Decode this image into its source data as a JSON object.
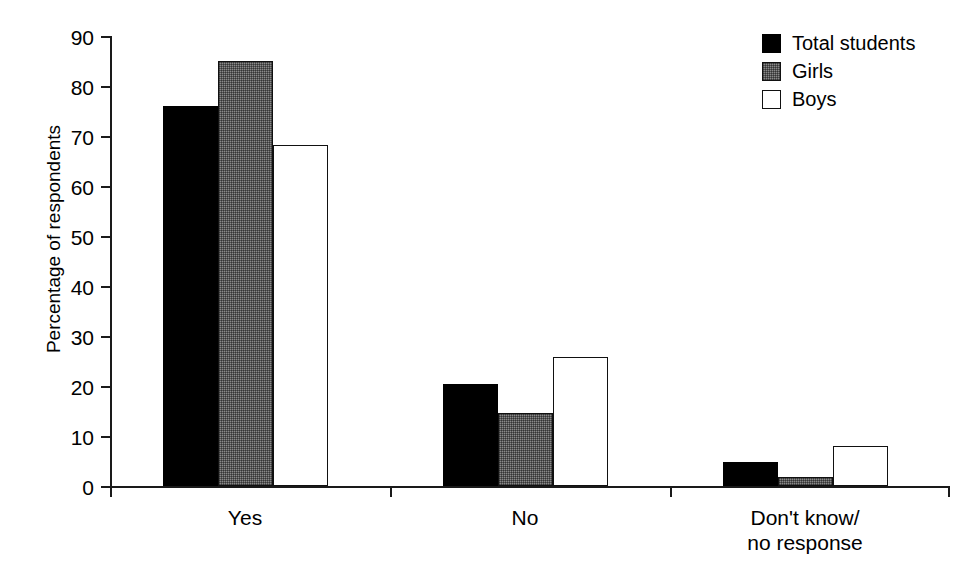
{
  "chart_data": {
    "type": "bar",
    "title": "",
    "xlabel": "",
    "ylabel": "Percentage of respondents",
    "ylim": [
      0,
      90
    ],
    "yticks": [
      0,
      10,
      20,
      30,
      40,
      50,
      60,
      70,
      80,
      90
    ],
    "ytick_labels": [
      "0",
      "10",
      "20",
      "30",
      "40",
      "50",
      "60",
      "70",
      "80",
      "90"
    ],
    "grid": false,
    "legend_position": "top-right",
    "categories": [
      "Yes",
      "No",
      "Don't know/\nno response"
    ],
    "category_lines": [
      [
        "Yes"
      ],
      [
        "No"
      ],
      [
        "Don't know/",
        "no response"
      ]
    ],
    "series": [
      {
        "name": "Total students",
        "color": "#000000",
        "fill": "solid-black",
        "values": [
          76.0,
          20.5,
          4.8
        ]
      },
      {
        "name": "Girls",
        "color": "#8a8a8a",
        "fill": "gray-halftone",
        "values": [
          85.0,
          14.7,
          1.8
        ]
      },
      {
        "name": "Boys",
        "color": "#ffffff",
        "fill": "white-outline",
        "values": [
          68.2,
          25.8,
          8.1
        ]
      }
    ]
  },
  "legend": {
    "items": [
      {
        "label": "Total students",
        "swatch": "legend-swatch-total-students"
      },
      {
        "label": "Girls",
        "swatch": "legend-swatch-girls"
      },
      {
        "label": "Boys",
        "swatch": "legend-swatch-boys"
      }
    ]
  },
  "axes": {
    "y_title": "Percentage of respondents"
  }
}
